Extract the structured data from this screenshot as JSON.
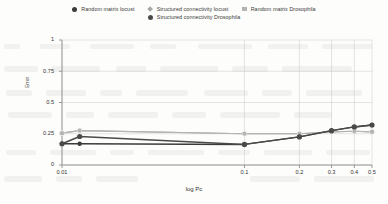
{
  "legend": {
    "rows": [
      [
        {
          "label": "Random matrix locust",
          "marker": "circle-dark",
          "color": "#3b3b3b"
        },
        {
          "label": "Structured connectivity locust",
          "marker": "diamond-light",
          "color": "#a8a8a8"
        },
        {
          "label": "Random matrix Drosophila",
          "marker": "square-light",
          "color": "#b4b4b4"
        }
      ],
      [
        {
          "label": "Structured connectivity Drosophila",
          "marker": "circle-mid",
          "color": "#4a4a4a"
        }
      ]
    ]
  },
  "chart_data": {
    "type": "line",
    "title": "",
    "xlabel": "log Pc",
    "ylabel": "Error",
    "xscale": "log",
    "xlim": [
      0.01,
      0.5
    ],
    "ylim": [
      0,
      1
    ],
    "xticks": [
      0.01,
      0.1,
      0.2,
      0.3,
      0.4,
      0.5
    ],
    "xticklabels": [
      "0.01",
      "0.1",
      "0.2",
      "0.3",
      "0.4",
      "0.5"
    ],
    "yticks": [
      0,
      0.25,
      0.5,
      0.75,
      1
    ],
    "yticklabels": [
      "0",
      "0.25",
      "0.5",
      "0.75",
      "1"
    ],
    "grid": true,
    "legend_position": "top",
    "x": [
      0.01,
      0.0125,
      0.1,
      0.2,
      0.3,
      0.4,
      0.5
    ],
    "series": [
      {
        "name": "Random matrix locust",
        "color": "#3b3b3b",
        "marker": "circle-dark",
        "values": [
          0.17,
          0.17,
          0.165,
          0.225,
          0.275,
          0.305,
          0.32
        ]
      },
      {
        "name": "Structured connectivity locust",
        "color": "#a8a8a8",
        "marker": "diamond-light",
        "values": [
          0.255,
          0.275,
          0.25,
          0.25,
          0.265,
          0.27,
          0.265
        ]
      },
      {
        "name": "Random matrix Drosophila",
        "color": "#b4b4b4",
        "marker": "square-light",
        "values": [
          0.255,
          0.275,
          0.25,
          0.25,
          0.265,
          0.27,
          0.265
        ]
      },
      {
        "name": "Structured connectivity Drosophila",
        "color": "#4a4a4a",
        "marker": "circle-mid",
        "values": [
          0.17,
          0.228,
          0.165,
          0.225,
          0.275,
          0.305,
          0.32
        ]
      }
    ]
  }
}
